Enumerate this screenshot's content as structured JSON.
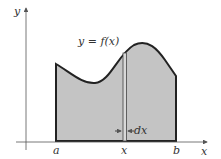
{
  "diagram": {
    "equation_label": "y = f(x)",
    "axes": {
      "x_label": "x",
      "y_label": "y"
    },
    "bounds": {
      "left_label": "a",
      "right_label": "b"
    },
    "strip": {
      "position_label": "x",
      "width_label": "dx"
    },
    "colors": {
      "fill": "#c4c4c4",
      "stroke": "#222222",
      "axis": "#555555",
      "strip_fill": "#d8d8d8"
    }
  }
}
